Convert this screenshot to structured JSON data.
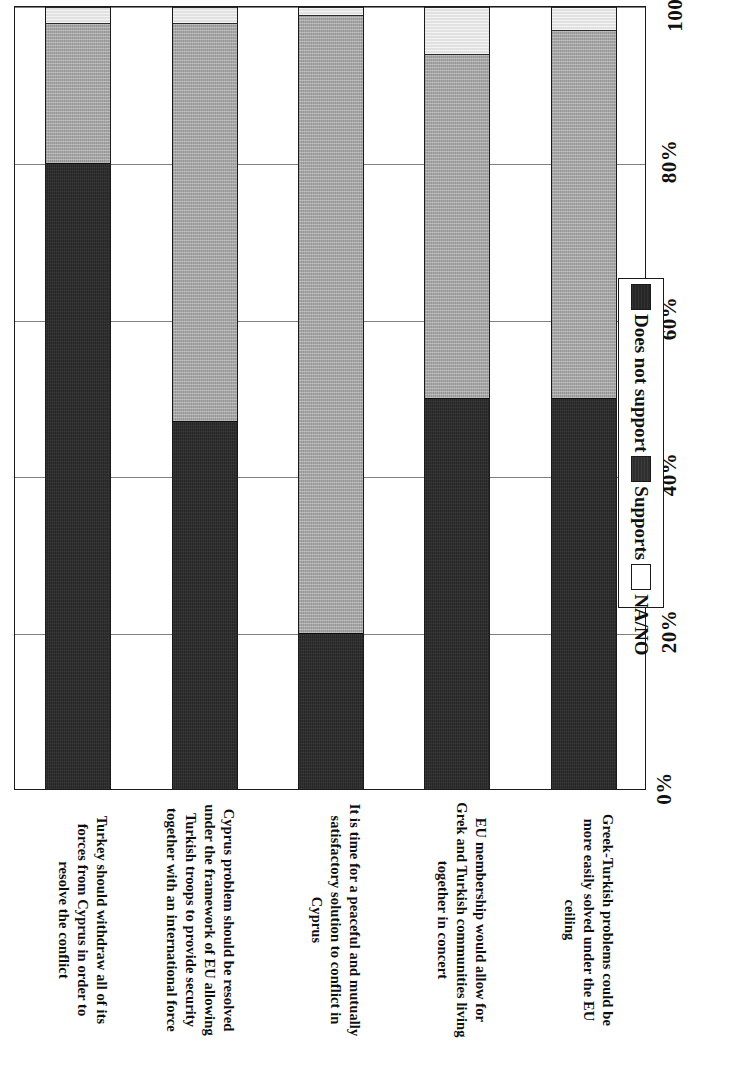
{
  "chart_data": {
    "type": "bar",
    "subtype": "stacked-horizontal-percent",
    "title": "",
    "xlabel": "",
    "ylabel": "",
    "orientation": "rotated-90",
    "grid": true,
    "axis_range": [
      0,
      100
    ],
    "axis_tick_labels": [
      "0%",
      "20%",
      "40%",
      "60%",
      "80%",
      "100%"
    ],
    "axis_tick_values": [
      0,
      20,
      40,
      60,
      80,
      100
    ],
    "legend_position": "right",
    "categories": [
      "Turkey should withdraw all of its forces from Cyprus in order to resolve the conflict",
      "Cyprus problem should be resolved under the framework of EU allowing Turkish troops to provide security together with an international force",
      "It is time for a peaceful and mutually satisfactory solution to conflict in Cyprus",
      "EU membership would allow for Grek and Turkish communities living together in concert",
      "Greek-Turkish problems could be more easily solved under the EU ceiling"
    ],
    "series": [
      {
        "name": "Does not support",
        "color": "#262626",
        "values": [
          80,
          47,
          20,
          50,
          50
        ]
      },
      {
        "name": "Supports",
        "color": "#a8a8a8",
        "values": [
          18,
          51,
          79,
          44,
          47
        ]
      },
      {
        "name": "NA/NO",
        "color": "#ffffff",
        "values": [
          2,
          2,
          1,
          6,
          3
        ]
      }
    ]
  },
  "legend": {
    "items": [
      {
        "label": "Does not support",
        "swatch": "dns"
      },
      {
        "label": "Supports",
        "swatch": "sup"
      },
      {
        "label": "NA/NO",
        "swatch": "na"
      }
    ]
  }
}
